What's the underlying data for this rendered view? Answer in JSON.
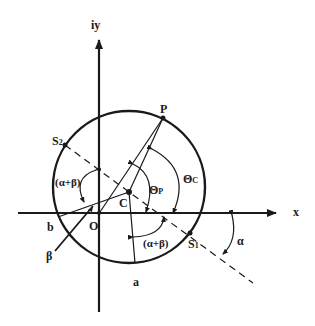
{
  "diagram": {
    "axes": {
      "x_label": "x",
      "y_label": "iy"
    },
    "points": {
      "origin": "O",
      "center": "C",
      "point_p": "P",
      "s1": "S",
      "s1_sub": "1",
      "s2": "S",
      "s2_sub": "2"
    },
    "segment_labels": {
      "a": "a",
      "b": "b",
      "beta_line": "β"
    },
    "angles": {
      "alpha_beta_upper": "(α+β)",
      "alpha_beta_lower": "(α+β)",
      "theta_p": "Θ",
      "theta_p_sub": "P",
      "theta_c": "Θ",
      "theta_c_sub": "C",
      "alpha": "α"
    },
    "colors": {
      "ink": "#1a1a1a",
      "background": "#ffffff"
    }
  }
}
